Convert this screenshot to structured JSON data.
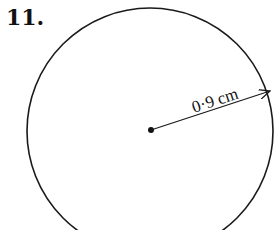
{
  "problem": {
    "number": "11.",
    "shape": "circle",
    "radius_label": "0·9 cm",
    "colors": {
      "stroke": "#1a1a1a",
      "background": "#ffffff"
    }
  }
}
